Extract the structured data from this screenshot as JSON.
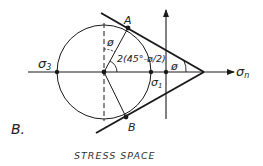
{
  "figure": {
    "panel_label": "B.",
    "caption": "STRESS SPACE",
    "labels": {
      "sigma3": "σ",
      "sigma3_sub": "3",
      "sigma1": "σ",
      "sigma1_sub": "1",
      "sigma_n": "σ",
      "sigma_n_sub": "n",
      "point_a": "A",
      "point_b": "B",
      "phi_top": "ø",
      "phi_apex": "ø",
      "angle_expr": "2(45°-ø/2)"
    },
    "colors": {
      "stroke": "#1a1a1a",
      "background": "#ffffff"
    }
  }
}
